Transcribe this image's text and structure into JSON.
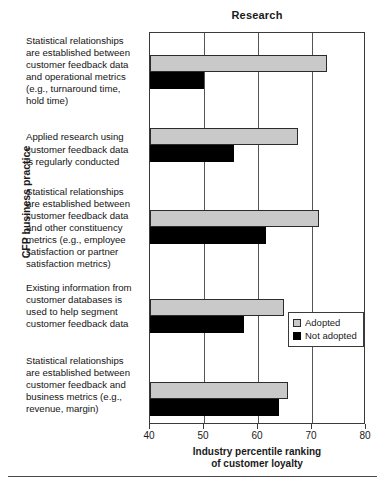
{
  "chart_data": {
    "type": "bar",
    "orientation": "horizontal",
    "title": "Research",
    "xlabel": "Industry percentile ranking of customer loyalty",
    "xlabel_line1": "Industry percentile ranking",
    "xlabel_line2": "of customer loyalty",
    "ylabel": "CFP business practice",
    "xlim": [
      40,
      80
    ],
    "xticks": [
      40,
      50,
      60,
      70,
      80
    ],
    "xtick_labels": [
      "40",
      "50",
      "60",
      "70",
      "80"
    ],
    "grid": true,
    "legend_position": "right-middle",
    "categories": [
      "Statistical relationships are established between customer feedback data and operational metrics (e.g., turnaround time, hold time)",
      "Applied research using customer feedback data is regularly conducted",
      "Statistical relationships are established between customer feedback data and other constituency metrics (e.g., employee satisfaction or partner satisfaction metrics)",
      "Existing information from customer databases is used to help segment customer feedback data",
      "Statistical relationships are established between customer feedback and business metrics (e.g., revenue, margin)"
    ],
    "category_lines": [
      [
        "Statistical relationships",
        "are established between",
        "customer feedback data",
        "and operational metrics",
        "(e.g., turnaround time,",
        "hold time)"
      ],
      [
        "Applied research using",
        "customer feedback data",
        "is regularly conducted"
      ],
      [
        "Statistical relationships",
        "are established between",
        "customer feedback data",
        "and other constituency",
        "metrics (e.g., employee",
        "satisfaction or partner",
        "satisfaction metrics)"
      ],
      [
        "Existing information from",
        "customer databases is",
        "used to help segment",
        "customer feedback data"
      ],
      [
        "Statistical relationships",
        "are established between",
        "customer feedback and",
        "business metrics (e.g.,",
        "revenue, margin)"
      ]
    ],
    "series": [
      {
        "name": "Adopted",
        "color": "#c9c9c9",
        "values": [
          72.8,
          67.4,
          71.3,
          64.8,
          65.5
        ]
      },
      {
        "name": "Not adopted",
        "color": "#000000",
        "values": [
          50.0,
          55.5,
          61.5,
          57.4,
          63.9
        ]
      }
    ]
  },
  "legend": {
    "items": [
      {
        "label": "Adopted",
        "color": "#c9c9c9"
      },
      {
        "label": "Not adopted",
        "color": "#000000"
      }
    ]
  }
}
